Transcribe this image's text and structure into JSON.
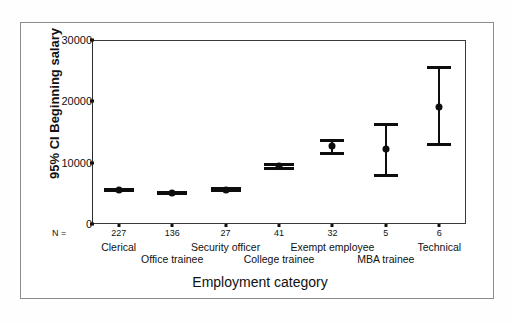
{
  "chart_data": {
    "type": "scatter",
    "title": "",
    "xlabel": "Employment category",
    "ylabel": "95% CI Beginning salary",
    "ylim": [
      0,
      30000
    ],
    "yticks": [
      0,
      10000,
      20000,
      30000
    ],
    "ytick_labels": [
      "0",
      "10000",
      "20000",
      "30000"
    ],
    "grid": false,
    "legend": null,
    "n_prefix": "N =",
    "categories": [
      "Clerical",
      "Office trainee",
      "Security officer",
      "College trainee",
      "Exempt employee",
      "MBA trainee",
      "Technical"
    ],
    "n_values": [
      "227",
      "136",
      "27",
      "41",
      "32",
      "5",
      "6"
    ],
    "series": [
      {
        "name": "Mean beginning salary",
        "values": [
          5500,
          5000,
          5600,
          9500,
          12700,
          12200,
          19100
        ]
      },
      {
        "name": "95% CI lower",
        "values": [
          5200,
          4700,
          5200,
          8800,
          11300,
          7600,
          12700
        ]
      },
      {
        "name": "95% CI upper",
        "values": [
          5800,
          5300,
          6000,
          10000,
          13800,
          16500,
          25700
        ]
      }
    ]
  },
  "style": {
    "marker_color": "#0d0d0d",
    "frame_color": "#3a3a3a",
    "outer_frame_color": "#8d8d8d"
  }
}
